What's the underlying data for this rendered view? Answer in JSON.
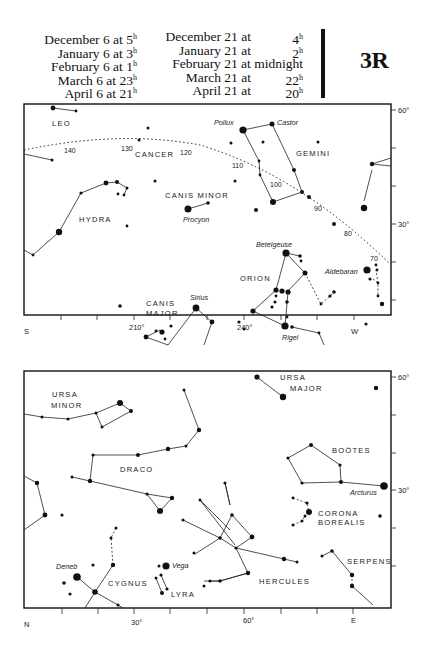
{
  "header": {
    "times_col1": [
      {
        "date": "December 6 at",
        "hour": "5",
        "unit": "h"
      },
      {
        "date": "January 6 at",
        "hour": "3",
        "unit": "h"
      },
      {
        "date": "February 6 at",
        "hour": "1",
        "unit": "h"
      },
      {
        "date": "March 6 at",
        "hour": "23",
        "unit": "h"
      },
      {
        "date": "April 6 at",
        "hour": "21",
        "unit": "h"
      }
    ],
    "times_col2": [
      {
        "date": "December 21 at",
        "hour": "4",
        "unit": "h"
      },
      {
        "date": "January 21 at",
        "hour": "2",
        "unit": "h"
      },
      {
        "date": "February 21 at midnight",
        "hour": "",
        "unit": ""
      },
      {
        "date": "March 21 at",
        "hour": "22",
        "unit": "h"
      },
      {
        "date": "April 21 at",
        "hour": "20",
        "unit": "h"
      }
    ],
    "plate_id": "3R"
  },
  "south_chart": {
    "direction_left": "S",
    "direction_right": "W",
    "azimuth_labels": [
      "210°",
      "240°"
    ],
    "altitude_labels": [
      "60°",
      "30°"
    ],
    "ecliptic_labels": [
      "140",
      "130",
      "120",
      "110",
      "100",
      "90",
      "80",
      "70"
    ],
    "constellations": [
      "LEO",
      "CANCER",
      "GEMINI",
      "HYDRA",
      "CANIS MINOR",
      "ORION",
      "CANIS",
      "MAJOR"
    ],
    "stars": [
      "Pollux",
      "Castor",
      "Procyon",
      "Betelgeuse",
      "Aldebaran",
      "Sirius",
      "Rigel"
    ]
  },
  "north_chart": {
    "direction_left": "N",
    "direction_right": "E",
    "azimuth_labels": [
      "30°",
      "60°"
    ],
    "altitude_labels": [
      "60°",
      "30°"
    ],
    "constellations": [
      "URSA",
      "MINOR",
      "URSA",
      "MAJOR",
      "DRACO",
      "BOÖTES",
      "CORONA",
      "BOREALIS",
      "CYGNUS",
      "LYRA",
      "HERCULES",
      "SERPENS"
    ],
    "stars": [
      "Arcturus",
      "Deneb",
      "Vega"
    ]
  }
}
